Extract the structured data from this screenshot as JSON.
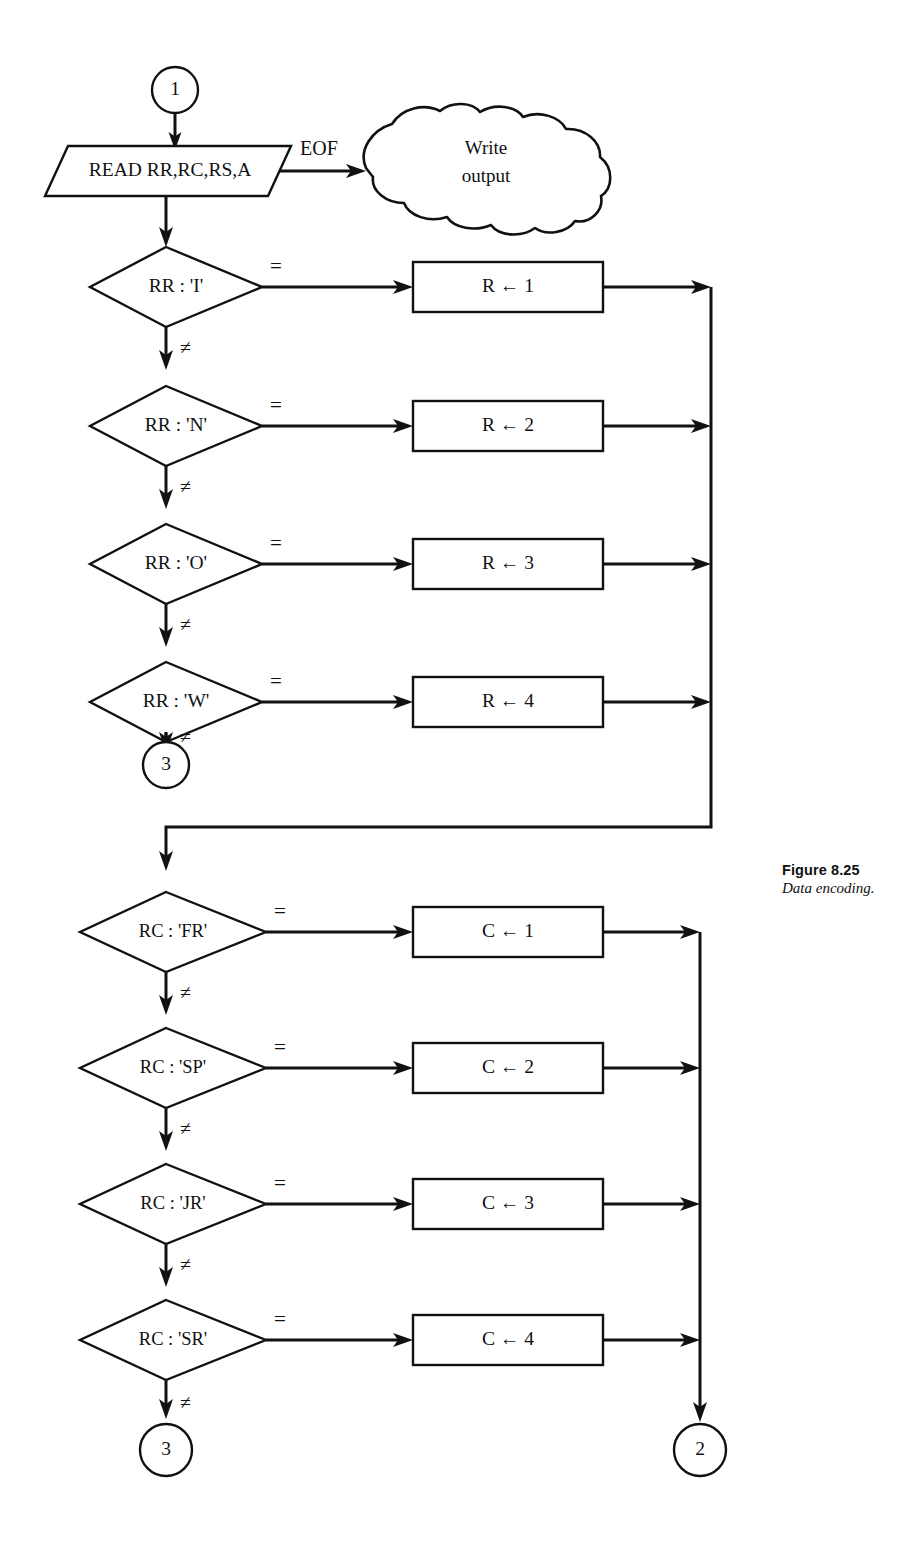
{
  "figure": {
    "caption_title": "Figure 8.25",
    "caption_subtitle": "Data encoding."
  },
  "diagram": {
    "type": "flowchart",
    "title": "Data encoding",
    "terminals": {
      "entry_top": "1",
      "exit_upper_left": "3",
      "exit_lower_left": "3",
      "exit_lower_right": "2"
    },
    "io": {
      "read_label": "READ RR,RC,RS,A",
      "eof_label": "EOF",
      "cloud_line1": "Write",
      "cloud_line2": "output"
    },
    "branch_labels": {
      "equal": "=",
      "not_equal": "≠"
    },
    "row_section_upper": [
      {
        "decision": "RR : 'I'",
        "equal": "=",
        "not_equal": "≠",
        "process": "R ← 1"
      },
      {
        "decision": "RR : 'N'",
        "equal": "=",
        "not_equal": "≠",
        "process": "R ← 2"
      },
      {
        "decision": "RR : 'O'",
        "equal": "=",
        "not_equal": "≠",
        "process": "R ← 3"
      },
      {
        "decision": "RR : 'W'",
        "equal": "=",
        "not_equal": "≠",
        "process": "R ← 4"
      }
    ],
    "row_section_lower": [
      {
        "decision": "RC : 'FR'",
        "equal": "=",
        "not_equal": "≠",
        "process": "C ← 1"
      },
      {
        "decision": "RC : 'SP'",
        "equal": "=",
        "not_equal": "≠",
        "process": "C ← 2"
      },
      {
        "decision": "RC : 'JR'",
        "equal": "=",
        "not_equal": "≠",
        "process": "C ← 3"
      },
      {
        "decision": "RC : 'SR'",
        "equal": "=",
        "not_equal": "≠",
        "process": "C ← 4"
      }
    ],
    "colors": {
      "ink": "#111111",
      "paper": "#ffffff"
    }
  }
}
